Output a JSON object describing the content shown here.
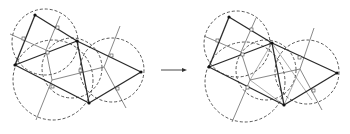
{
  "figure": {
    "panels": [
      {
        "name": "before",
        "offset": [
          0,
          0
        ],
        "vertices": {
          "A": [
            35,
            15
          ],
          "B": [
            77,
            41
          ],
          "C": [
            15,
            65
          ],
          "D": [
            89,
            103
          ],
          "E": [
            141,
            72
          ]
        },
        "edges": [
          [
            "A",
            "B"
          ],
          [
            "A",
            "C"
          ],
          [
            "B",
            "C"
          ],
          [
            "C",
            "D"
          ],
          [
            "B",
            "D"
          ],
          [
            "B",
            "E"
          ],
          [
            "D",
            "E"
          ]
        ],
        "circumcircles": [
          {
            "cx": 45,
            "cy": 42,
            "r": 33
          },
          {
            "cx": 53,
            "cy": 80,
            "r": 40
          },
          {
            "cx": 112,
            "cy": 72,
            "r": 33
          },
          {
            "cx": 70,
            "cy": 70,
            "r": 30
          }
        ]
      },
      {
        "name": "after",
        "offset": [
          192,
          2
        ],
        "vertices": {
          "A": [
            35,
            15
          ],
          "B": [
            80,
            41
          ],
          "C": [
            15,
            65
          ],
          "D": [
            92,
            103
          ],
          "E": [
            145,
            72
          ]
        },
        "edges": [
          [
            "A",
            "B"
          ],
          [
            "A",
            "C"
          ],
          [
            "B",
            "C"
          ],
          [
            "C",
            "D"
          ],
          [
            "B",
            "D"
          ],
          [
            "B",
            "E"
          ],
          [
            "D",
            "E"
          ]
        ],
        "circumcircles": [
          {
            "cx": 45,
            "cy": 42,
            "r": 33
          },
          {
            "cx": 53,
            "cy": 82,
            "r": 40
          },
          {
            "cx": 115,
            "cy": 72,
            "r": 33
          },
          {
            "cx": 72,
            "cy": 70,
            "r": 30
          }
        ]
      }
    ],
    "arrow": {
      "x1": 161,
      "y1": 70,
      "x2": 187,
      "y2": 70
    }
  }
}
